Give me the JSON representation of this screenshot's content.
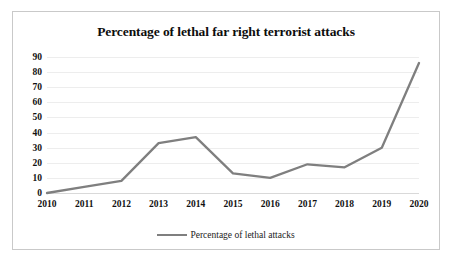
{
  "chart_data": {
    "type": "line",
    "title": "Percentage of lethal far right terrorist attacks",
    "xlabel": "",
    "ylabel": "",
    "categories": [
      "2010",
      "2011",
      "2012",
      "2013",
      "2014",
      "2015",
      "2016",
      "2017",
      "2018",
      "2019",
      "2020"
    ],
    "series": [
      {
        "name": "Percentage of lethal attacks",
        "color": "#7f7f7f",
        "values": [
          0,
          4,
          8,
          33,
          37,
          13,
          10,
          19,
          17,
          30,
          86
        ]
      }
    ],
    "ylim": [
      0,
      90
    ],
    "yticks": [
      0,
      10,
      20,
      30,
      40,
      50,
      60,
      70,
      80,
      90
    ],
    "ytick_labels": [
      "0",
      "10",
      "20",
      "30",
      "40",
      "50",
      "60",
      "70",
      "80",
      "90"
    ],
    "grid": true,
    "legend_position": "bottom",
    "legend_entries": [
      "Percentage of lethal attacks"
    ],
    "line_color": "#7f7f7f",
    "background_color": "#ffffff",
    "gridline_color": "#ededed",
    "border_color": "#c9c9c9"
  }
}
